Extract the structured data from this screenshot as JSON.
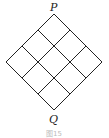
{
  "figure": {
    "grid": {
      "rows": 3,
      "cols": 3,
      "orientation": "diamond"
    },
    "labels": {
      "top": "P",
      "bottom": "Q"
    },
    "caption": "图15",
    "line_color": "#222222"
  }
}
